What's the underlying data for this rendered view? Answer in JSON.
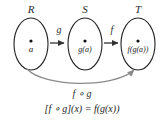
{
  "diagram": {
    "title_visible": false,
    "background_color": "#ffffff",
    "sets": [
      {
        "id": "R",
        "label": "R",
        "element_label": "a"
      },
      {
        "id": "S",
        "label": "S",
        "element_label": "g(a)"
      },
      {
        "id": "T",
        "label": "T",
        "element_label": "f(g(a))"
      }
    ],
    "maps": [
      {
        "id": "g",
        "label": "g",
        "from": "R",
        "to": "S"
      },
      {
        "id": "f",
        "label": "f",
        "from": "S",
        "to": "T"
      }
    ],
    "composition": {
      "label": "f ∘ g",
      "from": "R",
      "to": "T",
      "color": "#8a8a8a"
    },
    "formula": "[f ∘ g](x) = f(g(x))",
    "colors": {
      "ellipse_stroke": "#222222",
      "arrow": "#333333",
      "curve_arrow": "#8a8a8a",
      "text": "#1a1a1a"
    }
  }
}
